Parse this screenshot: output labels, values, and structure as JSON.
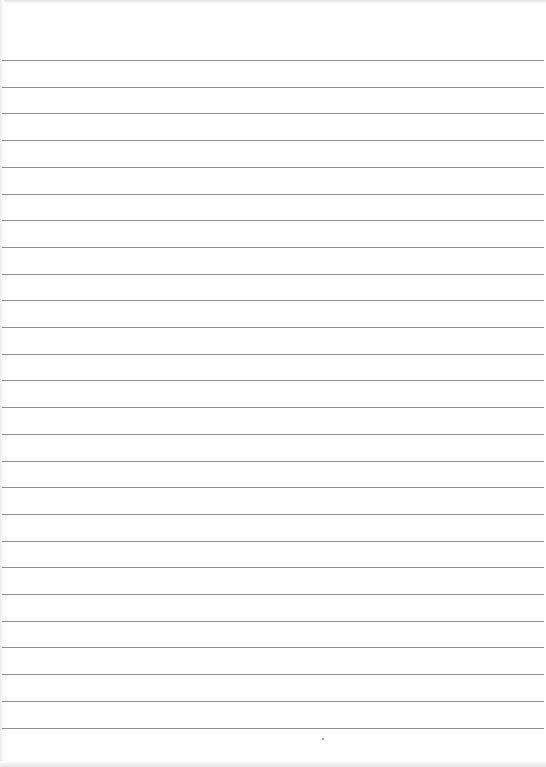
{
  "document": {
    "type": "lined paper",
    "line_count": 26,
    "first_line_y": 60,
    "line_spacing_px": 26.7,
    "line_color": "#8e8e8e",
    "paper_color": "#fefefe",
    "text": ""
  }
}
